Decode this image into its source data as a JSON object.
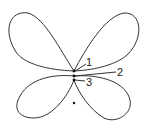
{
  "diagram": {
    "type": "butterfly curve",
    "labels": [
      {
        "id": "1",
        "text": "1"
      },
      {
        "id": "2",
        "text": "2"
      },
      {
        "id": "3",
        "text": "3"
      }
    ],
    "stroke_color": "#333333",
    "background": "#ffffff"
  }
}
